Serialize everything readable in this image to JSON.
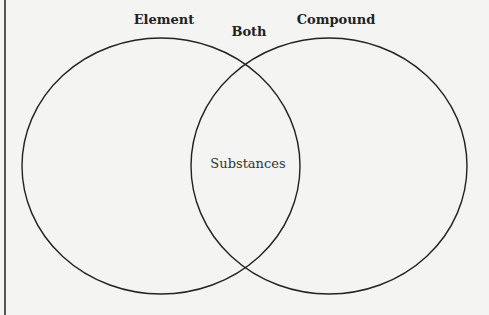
{
  "diagram": {
    "type": "venn",
    "sets": [
      {
        "id": "left",
        "label": "Element"
      },
      {
        "id": "right",
        "label": "Compound"
      }
    ],
    "intersection_label": "Both",
    "center_text": "Substances",
    "colors": {
      "background": "#f4f4f2",
      "stroke": "#222222"
    }
  }
}
